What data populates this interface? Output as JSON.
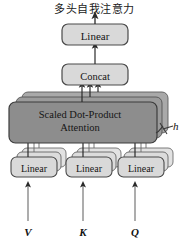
{
  "figure": {
    "caption": "多头自我注意力",
    "background_color": "#ffffff"
  },
  "nodes": {
    "output_linear": {
      "label": "Linear",
      "fill": "#d9d9d9",
      "stroke": "#4a4a4a"
    },
    "concat": {
      "label": "Concat",
      "fill": "#d9d9d9",
      "stroke": "#4a4a4a"
    },
    "attention": {
      "label_line1": "Scaled Dot-Product",
      "label_line2": "Attention",
      "fill": "#8d8d8d",
      "stroke": "#3c3c3c",
      "stack_count": 3
    },
    "linear_v": {
      "label": "Linear",
      "fill": "#d9d9d9",
      "stroke": "#4a4a4a",
      "stack_count": 3
    },
    "linear_k": {
      "label": "Linear",
      "fill": "#d9d9d9",
      "stroke": "#4a4a4a",
      "stack_count": 3
    },
    "linear_q": {
      "label": "Linear",
      "fill": "#d9d9d9",
      "stroke": "#4a4a4a",
      "stack_count": 3
    }
  },
  "annotations": {
    "heads_label": "h"
  },
  "inputs": {
    "v_label": "V",
    "k_label": "K",
    "q_label": "Q"
  },
  "colors": {
    "arrow": "#2a2a2a",
    "line": "#5a5a5a",
    "text": "#151515",
    "attention_fill": "#8d8d8d",
    "attention_back1": "#9a9a9a",
    "attention_back2": "#a8a8a8",
    "light_fill": "#d9d9d9",
    "light_back": "#e2e2e2"
  }
}
